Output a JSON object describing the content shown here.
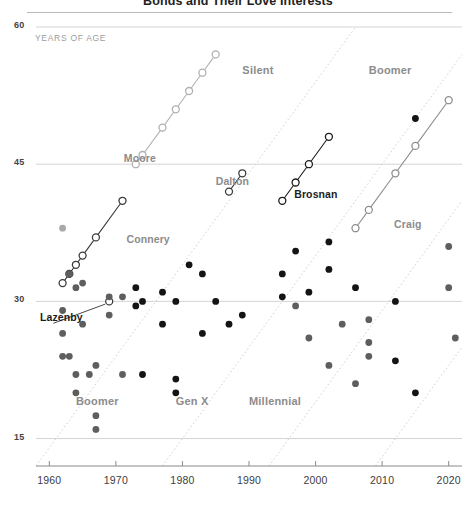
{
  "header": {
    "title": "Bonds and Their Love Interests"
  },
  "axes": {
    "y_unit_label": "YEARS OF AGE",
    "y_ticks": [
      60,
      45,
      30,
      15
    ],
    "x_ticks": [
      1960,
      1970,
      1980,
      1990,
      2000,
      2010,
      2020
    ],
    "xlim": [
      1958,
      2022
    ],
    "ylim": [
      12,
      60
    ]
  },
  "generation_labels_top": [
    {
      "label": "Silent",
      "x": 1989,
      "y": 55.2
    },
    {
      "label": "Boomer",
      "x": 2008,
      "y": 55.2
    }
  ],
  "generation_labels_bottom": [
    {
      "label": "Boomer",
      "x": 1964,
      "y": 19.0
    },
    {
      "label": "Gen X",
      "x": 1979,
      "y": 19.0
    },
    {
      "label": "Millennial",
      "x": 1990,
      "y": 19.0
    }
  ],
  "actor_labels": [
    {
      "label": "Moore",
      "x": 1971.2,
      "y": 45.6,
      "style": "muted"
    },
    {
      "label": "Connery",
      "x": 1971.6,
      "y": 36.7,
      "style": "muted"
    },
    {
      "label": "Dalton",
      "x": 1985.0,
      "y": 43.0,
      "style": "muted"
    },
    {
      "label": "Brosnan",
      "x": 1996.8,
      "y": 41.6,
      "style": "dark"
    },
    {
      "label": "Craig",
      "x": 2011.8,
      "y": 38.4,
      "style": "muted"
    },
    {
      "label": "Lazenby",
      "x": 1958.6,
      "y": 28.2,
      "style": "dark"
    }
  ],
  "colors": {
    "bond_dark": "#1c1c1c",
    "bond_mid": "#6e6e6e",
    "bond_light": "#b5b5b5",
    "interest_dark": "#141414",
    "interest_mid": "#5e5e5e",
    "interest_light": "#a8a8a8",
    "gridline": "#d4d4d4",
    "generation_divider": "#cfcfcf",
    "axis": "#8a8a8a"
  },
  "chart_data": {
    "type": "scatter",
    "title": "Bonds and Their Love Interests",
    "xlabel": "",
    "ylabel": "YEARS OF AGE",
    "xlim": [
      1958,
      2022
    ],
    "ylim": [
      12,
      60
    ],
    "grid": "horizontal",
    "legend": "none",
    "series": [
      {
        "name": "Connery",
        "role": "bond",
        "marker": "open-circle",
        "color": "#3a3a3a",
        "line": true,
        "points": [
          {
            "x": 1962,
            "y": 32.0
          },
          {
            "x": 1963,
            "y": 33.0
          },
          {
            "x": 1964,
            "y": 34.0
          },
          {
            "x": 1965,
            "y": 35.0
          },
          {
            "x": 1967,
            "y": 37.0
          },
          {
            "x": 1971,
            "y": 41.0
          }
        ]
      },
      {
        "name": "Lazenby",
        "role": "bond",
        "marker": "open-circle",
        "color": "#3a3a3a",
        "line": false,
        "points": [
          {
            "x": 1969,
            "y": 30.0
          }
        ]
      },
      {
        "name": "Moore",
        "role": "bond",
        "marker": "open-circle",
        "color": "#b0b0b0",
        "line": true,
        "points": [
          {
            "x": 1973,
            "y": 45.0
          },
          {
            "x": 1974,
            "y": 46.0
          },
          {
            "x": 1977,
            "y": 49.0
          },
          {
            "x": 1979,
            "y": 51.0
          },
          {
            "x": 1981,
            "y": 53.0
          },
          {
            "x": 1983,
            "y": 55.0
          },
          {
            "x": 1985,
            "y": 57.0
          }
        ]
      },
      {
        "name": "Dalton",
        "role": "bond",
        "marker": "open-circle",
        "color": "#3a3a3a",
        "line": true,
        "points": [
          {
            "x": 1987,
            "y": 42.0
          },
          {
            "x": 1989,
            "y": 44.0
          }
        ]
      },
      {
        "name": "Brosnan",
        "role": "bond",
        "marker": "open-circle",
        "color": "#1c1c1c",
        "line": true,
        "points": [
          {
            "x": 1995,
            "y": 41.0
          },
          {
            "x": 1997,
            "y": 43.0
          },
          {
            "x": 1999,
            "y": 45.0
          },
          {
            "x": 2002,
            "y": 48.0
          }
        ]
      },
      {
        "name": "Craig",
        "role": "bond",
        "marker": "open-circle",
        "color": "#8e8e8e",
        "line": true,
        "points": [
          {
            "x": 2006,
            "y": 38.0
          },
          {
            "x": 2008,
            "y": 40.0
          },
          {
            "x": 2012,
            "y": 44.0
          },
          {
            "x": 2015,
            "y": 47.0
          },
          {
            "x": 2020,
            "y": 52.0
          }
        ]
      },
      {
        "name": "Love interests",
        "role": "interest",
        "marker": "filled-dot",
        "line": false,
        "points": [
          {
            "x": 1962,
            "y": 29.0,
            "shade": "mid"
          },
          {
            "x": 1962,
            "y": 26.5,
            "shade": "mid"
          },
          {
            "x": 1962,
            "y": 24.0,
            "shade": "mid"
          },
          {
            "x": 1962,
            "y": 38.0,
            "shade": "light"
          },
          {
            "x": 1963,
            "y": 33.0,
            "shade": "mid"
          },
          {
            "x": 1963,
            "y": 24.0,
            "shade": "mid"
          },
          {
            "x": 1964,
            "y": 31.5,
            "shade": "mid"
          },
          {
            "x": 1964,
            "y": 22.0,
            "shade": "mid"
          },
          {
            "x": 1964,
            "y": 20.0,
            "shade": "mid"
          },
          {
            "x": 1965,
            "y": 32.0,
            "shade": "mid"
          },
          {
            "x": 1965,
            "y": 27.5,
            "shade": "mid"
          },
          {
            "x": 1966,
            "y": 22.0,
            "shade": "mid"
          },
          {
            "x": 1967,
            "y": 23.0,
            "shade": "mid"
          },
          {
            "x": 1967,
            "y": 17.5,
            "shade": "mid"
          },
          {
            "x": 1967,
            "y": 16.0,
            "shade": "mid"
          },
          {
            "x": 1969,
            "y": 30.5,
            "shade": "mid"
          },
          {
            "x": 1969,
            "y": 28.5,
            "shade": "mid"
          },
          {
            "x": 1971,
            "y": 30.5,
            "shade": "mid"
          },
          {
            "x": 1971,
            "y": 22.0,
            "shade": "mid"
          },
          {
            "x": 1973,
            "y": 31.5,
            "shade": "dark"
          },
          {
            "x": 1973,
            "y": 29.5,
            "shade": "dark"
          },
          {
            "x": 1974,
            "y": 30.0,
            "shade": "dark"
          },
          {
            "x": 1974,
            "y": 22.0,
            "shade": "dark"
          },
          {
            "x": 1977,
            "y": 31.0,
            "shade": "dark"
          },
          {
            "x": 1977,
            "y": 27.5,
            "shade": "dark"
          },
          {
            "x": 1979,
            "y": 30.0,
            "shade": "dark"
          },
          {
            "x": 1979,
            "y": 21.5,
            "shade": "dark"
          },
          {
            "x": 1979,
            "y": 20.0,
            "shade": "dark"
          },
          {
            "x": 1981,
            "y": 34.0,
            "shade": "dark"
          },
          {
            "x": 1983,
            "y": 33.0,
            "shade": "dark"
          },
          {
            "x": 1983,
            "y": 26.5,
            "shade": "dark"
          },
          {
            "x": 1985,
            "y": 30.0,
            "shade": "dark"
          },
          {
            "x": 1987,
            "y": 27.5,
            "shade": "dark"
          },
          {
            "x": 1989,
            "y": 28.5,
            "shade": "dark"
          },
          {
            "x": 1995,
            "y": 33.0,
            "shade": "dark"
          },
          {
            "x": 1995,
            "y": 30.5,
            "shade": "dark"
          },
          {
            "x": 1997,
            "y": 35.5,
            "shade": "dark"
          },
          {
            "x": 1997,
            "y": 29.5,
            "shade": "mid"
          },
          {
            "x": 1999,
            "y": 31.0,
            "shade": "dark"
          },
          {
            "x": 1999,
            "y": 26.0,
            "shade": "mid"
          },
          {
            "x": 2002,
            "y": 36.5,
            "shade": "dark"
          },
          {
            "x": 2002,
            "y": 33.5,
            "shade": "dark"
          },
          {
            "x": 2002,
            "y": 23.0,
            "shade": "mid"
          },
          {
            "x": 2004,
            "y": 27.5,
            "shade": "mid"
          },
          {
            "x": 2006,
            "y": 31.5,
            "shade": "dark"
          },
          {
            "x": 2006,
            "y": 21.0,
            "shade": "mid"
          },
          {
            "x": 2008,
            "y": 28.0,
            "shade": "mid"
          },
          {
            "x": 2008,
            "y": 25.5,
            "shade": "mid"
          },
          {
            "x": 2008,
            "y": 24.0,
            "shade": "mid"
          },
          {
            "x": 2012,
            "y": 30.0,
            "shade": "dark"
          },
          {
            "x": 2012,
            "y": 23.5,
            "shade": "dark"
          },
          {
            "x": 2015,
            "y": 50.0,
            "shade": "dark"
          },
          {
            "x": 2015,
            "y": 20.0,
            "shade": "dark"
          },
          {
            "x": 2020,
            "y": 36.0,
            "shade": "mid"
          },
          {
            "x": 2020,
            "y": 31.5,
            "shade": "mid"
          },
          {
            "x": 2021,
            "y": 26.0,
            "shade": "mid"
          }
        ]
      }
    ],
    "generation_boundaries": [
      {
        "label": "Silent/Boomer",
        "birth_year": 1946
      },
      {
        "label": "Boomer/Gen X",
        "birth_year": 1965
      },
      {
        "label": "Gen X/Millennial",
        "birth_year": 1981
      },
      {
        "label": "Millennial/Gen Z",
        "birth_year": 1997
      }
    ]
  }
}
